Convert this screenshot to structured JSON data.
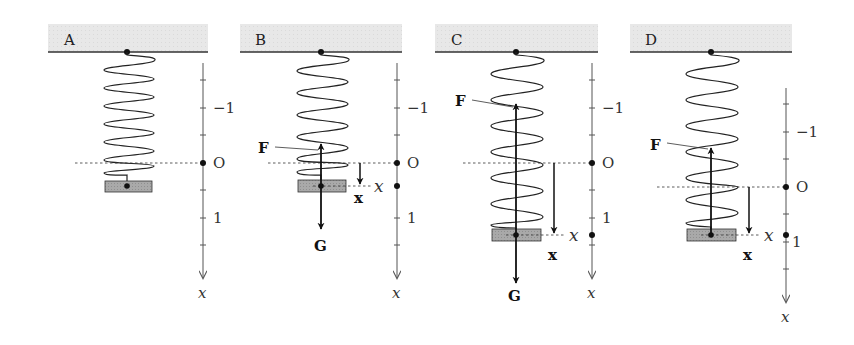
{
  "figure": {
    "colors": {
      "ceiling_fill": "#e6e6e6",
      "block_fill": "#a9a9a9",
      "line": "#111111",
      "axis": "#555555"
    },
    "axis_labels": {
      "minus_one": "−1",
      "origin": "O",
      "one": "1",
      "axis_var": "x"
    },
    "panels": [
      {
        "id": "A",
        "label": "A",
        "force_up": null,
        "force_down": null,
        "displacement_label": null,
        "position_label": null
      },
      {
        "id": "B",
        "label": "B",
        "force_up": "F",
        "force_down": "G",
        "displacement_label": "x",
        "position_label": "x"
      },
      {
        "id": "C",
        "label": "C",
        "force_up": "F",
        "force_down": "G",
        "displacement_label": "x",
        "position_label": "x"
      },
      {
        "id": "D",
        "label": "D",
        "force_up": "F",
        "force_down": null,
        "displacement_label": "x",
        "position_label": "x"
      }
    ]
  }
}
